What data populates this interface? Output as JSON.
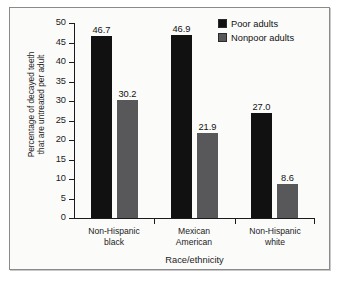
{
  "chart_data": {
    "type": "bar",
    "title": "",
    "xlabel": "Race/ethnicity",
    "ylabel": "Percentage of decayed teeth\nthat are untreated per adult",
    "categories": [
      "Non-Hispanic\nblack",
      "Mexican\nAmerican",
      "Non-Hispanic\nwhite"
    ],
    "series": [
      {
        "name": "Poor adults",
        "color": "#111111",
        "values": [
          46.7,
          46.9,
          27.0
        ],
        "labels": [
          "46.7",
          "46.9",
          "27.0"
        ]
      },
      {
        "name": "Nonpoor adults",
        "color": "#58585a",
        "values": [
          30.2,
          21.9,
          8.6
        ],
        "labels": [
          "30.2",
          "21.9",
          "8.6"
        ]
      }
    ],
    "ylim": [
      0,
      50
    ],
    "yticks": [
      0,
      5,
      10,
      15,
      20,
      25,
      30,
      35,
      40,
      45,
      50
    ],
    "ytick_labels": [
      "0",
      "5",
      "10",
      "15",
      "20",
      "25",
      "30",
      "35",
      "40",
      "45",
      "50"
    ],
    "grid": false,
    "legend_position": "top-right"
  },
  "legend": {
    "entries": [
      {
        "label": "Poor adults",
        "color": "#111111"
      },
      {
        "label": "Nonpoor adults",
        "color": "#58585a"
      }
    ]
  }
}
